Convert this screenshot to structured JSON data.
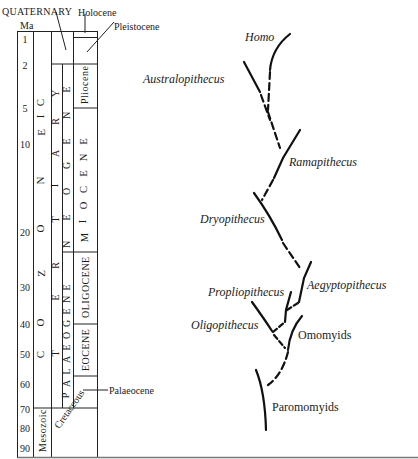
{
  "figure": {
    "type": "geologic time scale with primate phylogeny",
    "axis_label": "Ma",
    "ticks": [
      {
        "label": "1",
        "y": 36
      },
      {
        "label": "2",
        "y": 66
      },
      {
        "label": "5",
        "y": 109
      },
      {
        "label": "10",
        "y": 145
      },
      {
        "label": "20",
        "y": 232
      },
      {
        "label": "30",
        "y": 287
      },
      {
        "label": "40",
        "y": 325
      },
      {
        "label": "50",
        "y": 354
      },
      {
        "label": "60",
        "y": 384
      },
      {
        "label": "70",
        "y": 409
      },
      {
        "label": "80",
        "y": 428
      },
      {
        "label": "90",
        "y": 448
      }
    ],
    "eras": {
      "cenozoic_letters": [
        "C",
        "E",
        "N",
        "O",
        "Z",
        "O",
        "I",
        "C"
      ],
      "mesozoic": "Mesozoic"
    },
    "periods": {
      "quaternary": "QUATERNARY",
      "tertiary_letters": [
        "T",
        "E",
        "R",
        "T",
        "I",
        "A",
        "R",
        "Y"
      ],
      "cretaceous": "Cretaceous"
    },
    "subperiods": {
      "neogene_letters": [
        "N",
        "E",
        "O",
        "G",
        "E",
        "N",
        "E"
      ],
      "palaeogene_letters": [
        "P",
        "A",
        "L",
        "A",
        "E",
        "O",
        "G",
        "E",
        "N",
        "E"
      ]
    },
    "epochs": {
      "holocene": "Holocene",
      "pleistocene": "Pleistocene",
      "pliocene": "Pliocene",
      "miocene_letters": [
        "M",
        "I",
        "O",
        "C",
        "E",
        "N",
        "E"
      ],
      "oligocene": "OLIGOCENE",
      "eocene": "EOCENE",
      "palaeocene": "Palaeocene"
    },
    "taxa": {
      "homo": "Homo",
      "australopithecus": "Australopithecus",
      "ramapithecus": "Ramapithecus",
      "dryopithecus": "Dryopithecus",
      "aegyptopithecus": "Aegyptopithecus",
      "propliopithecus": "Propliopithecus",
      "oligopithecus": "Oligopithecus",
      "omomyids": "Omomyids",
      "paromomyids": "Paromomyids"
    }
  }
}
